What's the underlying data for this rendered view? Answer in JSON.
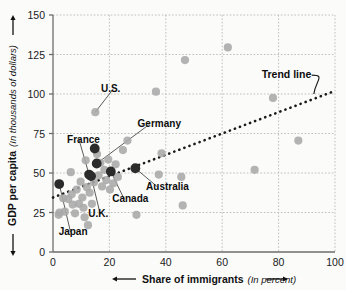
{
  "chart_data": {
    "type": "scatter",
    "title": "",
    "xlabel": "Share of immigrants",
    "xlabel_unit": "(In percent)",
    "ylabel": "GDP per capita",
    "ylabel_unit": "(In thousands of dollars)",
    "xlim": [
      0,
      100
    ],
    "ylim": [
      0,
      150
    ],
    "xticks": [
      0,
      20,
      40,
      60,
      80,
      100
    ],
    "yticks": [
      0,
      25,
      50,
      75,
      100,
      125,
      150
    ],
    "grid": true,
    "legend": "none",
    "colors": {
      "point_light": "#a9a9a9",
      "point_highlight": "#2b2b2b",
      "trend_line": "#1a1a1a",
      "grid": "#b9b9b9",
      "axis": "#6d6d6d",
      "background": "#fbfbfa",
      "text": "#0d0d0d"
    },
    "annotations": [
      {
        "label": "U.S.",
        "text_x": 17.0,
        "text_y": 101.0,
        "point_x": 15.0,
        "point_y": 88.5
      },
      {
        "label": "Germany",
        "text_x": 30.0,
        "text_y": 79.0,
        "point_x": 15.5,
        "point_y": 56.0
      },
      {
        "label": "France",
        "text_x": 5.0,
        "text_y": 69.0,
        "point_x": 12.8,
        "point_y": 49.0
      },
      {
        "label": "Canada",
        "text_x": 21.0,
        "text_y": 31.5,
        "point_x": 20.5,
        "point_y": 51.0
      },
      {
        "label": "U.K.",
        "text_x": 12.5,
        "text_y": 22.0,
        "point_x": 13.5,
        "point_y": 48.0
      },
      {
        "label": "Japan",
        "text_x": 2.0,
        "text_y": 10.5,
        "point_x": 2.2,
        "point_y": 43.0
      },
      {
        "label": "Australia",
        "text_x": 33.0,
        "text_y": 39.0,
        "point_x": 29.2,
        "point_y": 53.0
      },
      {
        "label": "Trend line",
        "text_x": 74.0,
        "text_y": 110.0,
        "point_x": 92.5,
        "point_y": 100.0
      }
    ],
    "trend_line": {
      "x0": 0.0,
      "y0": 34.5,
      "x1": 100.0,
      "y1": 102.0,
      "style": "dotted"
    },
    "highlighted_points": [
      {
        "name": "Japan",
        "x": 2.2,
        "y": 43.0
      },
      {
        "name": "France",
        "x": 12.8,
        "y": 49.0
      },
      {
        "name": "U.K.",
        "x": 13.5,
        "y": 48.0
      },
      {
        "name": "U.S.",
        "x": 14.8,
        "y": 65.5
      },
      {
        "name": "Germany",
        "x": 15.5,
        "y": 56.0
      },
      {
        "name": "Canada",
        "x": 20.5,
        "y": 51.0
      },
      {
        "name": "Australia",
        "x": 29.2,
        "y": 53.0
      }
    ],
    "points": [
      {
        "x": 2.0,
        "y": 23.5
      },
      {
        "x": 2.3,
        "y": 25.0
      },
      {
        "x": 3.6,
        "y": 34.0
      },
      {
        "x": 4.2,
        "y": 25.5
      },
      {
        "x": 5.4,
        "y": 33.5
      },
      {
        "x": 6.3,
        "y": 50.5
      },
      {
        "x": 6.6,
        "y": 36.5
      },
      {
        "x": 7.0,
        "y": 30.0
      },
      {
        "x": 7.8,
        "y": 24.5
      },
      {
        "x": 8.4,
        "y": 39.5
      },
      {
        "x": 9.2,
        "y": 30.5
      },
      {
        "x": 9.8,
        "y": 44.5
      },
      {
        "x": 10.4,
        "y": 34.5
      },
      {
        "x": 10.8,
        "y": 28.0
      },
      {
        "x": 11.2,
        "y": 22.0
      },
      {
        "x": 11.6,
        "y": 58.0
      },
      {
        "x": 12.0,
        "y": 41.0
      },
      {
        "x": 12.4,
        "y": 17.0
      },
      {
        "x": 13.0,
        "y": 37.5
      },
      {
        "x": 13.8,
        "y": 30.5
      },
      {
        "x": 14.5,
        "y": 44.0
      },
      {
        "x": 15.0,
        "y": 88.5
      },
      {
        "x": 15.6,
        "y": 62.0
      },
      {
        "x": 16.2,
        "y": 48.5
      },
      {
        "x": 16.8,
        "y": 56.5
      },
      {
        "x": 17.4,
        "y": 41.5
      },
      {
        "x": 18.2,
        "y": 52.0
      },
      {
        "x": 18.9,
        "y": 45.5
      },
      {
        "x": 19.6,
        "y": 58.5
      },
      {
        "x": 20.2,
        "y": 39.5
      },
      {
        "x": 21.4,
        "y": 43.5
      },
      {
        "x": 22.2,
        "y": 55.5
      },
      {
        "x": 23.0,
        "y": 47.5
      },
      {
        "x": 24.8,
        "y": 64.5
      },
      {
        "x": 26.4,
        "y": 70.5
      },
      {
        "x": 29.6,
        "y": 23.5
      },
      {
        "x": 36.5,
        "y": 101.5
      },
      {
        "x": 37.5,
        "y": 49.0
      },
      {
        "x": 38.5,
        "y": 62.5
      },
      {
        "x": 45.5,
        "y": 47.5
      },
      {
        "x": 46.0,
        "y": 29.5
      },
      {
        "x": 46.8,
        "y": 121.5
      },
      {
        "x": 62.0,
        "y": 129.5
      },
      {
        "x": 71.5,
        "y": 52.0
      },
      {
        "x": 78.0,
        "y": 97.5
      },
      {
        "x": 87.0,
        "y": 70.5
      }
    ]
  }
}
